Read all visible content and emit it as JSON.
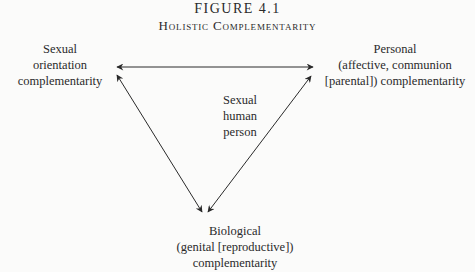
{
  "figure": {
    "number": "FIGURE 4.1",
    "title": "Holistic Complementarity"
  },
  "nodes": {
    "left": {
      "lines": [
        "Sexual",
        "orientation",
        "complementarity"
      ]
    },
    "right": {
      "lines": [
        "Personal",
        "(affective, communion",
        "[parental]) complementarity"
      ]
    },
    "center": {
      "lines": [
        "Sexual",
        "human",
        "person"
      ]
    },
    "bottom": {
      "lines": [
        "Biological",
        "(genital [reproductive])",
        "complementarity"
      ]
    }
  },
  "edges": [
    {
      "from": "left",
      "to": "right",
      "bidirectional": true
    },
    {
      "from": "left",
      "to": "bottom",
      "bidirectional": true
    },
    {
      "from": "right",
      "to": "bottom",
      "bidirectional": true
    }
  ],
  "colors": {
    "line": "#2a2a2a",
    "background": "#fbfbfa"
  }
}
